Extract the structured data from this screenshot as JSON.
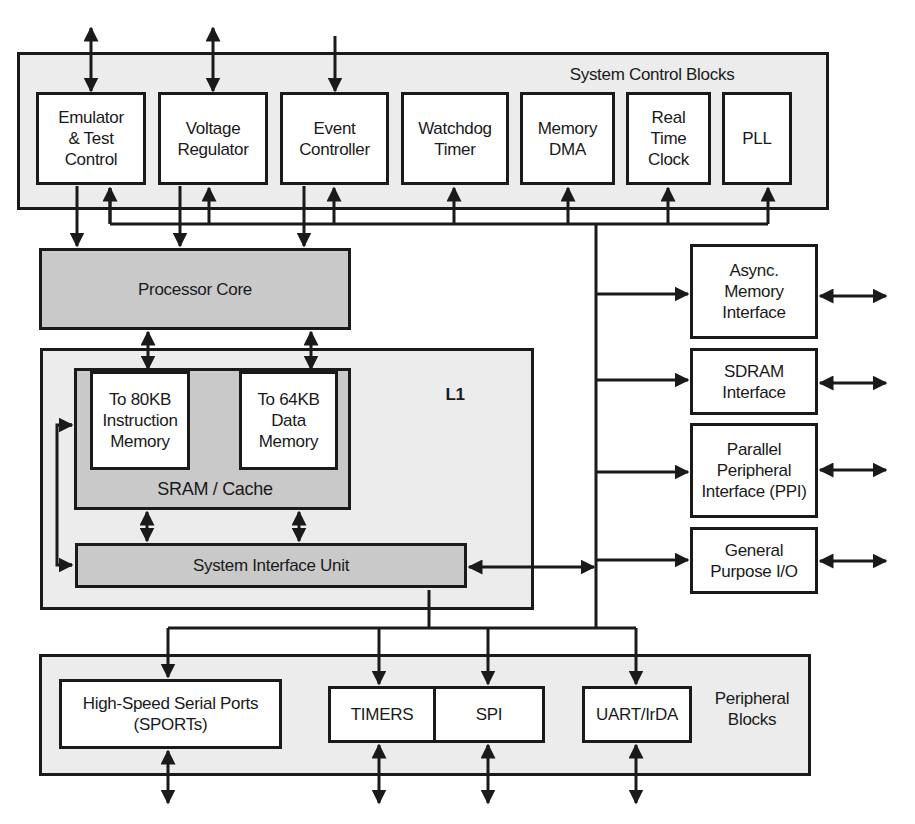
{
  "system_control": {
    "title": "System Control Blocks",
    "blocks": [
      {
        "label": "Emulator\n& Test\nControl"
      },
      {
        "label": "Voltage\nRegulator"
      },
      {
        "label": "Event\nController"
      },
      {
        "label": "Watchdog\nTimer"
      },
      {
        "label": "Memory\nDMA"
      },
      {
        "label": "Real\nTime\nClock"
      },
      {
        "label": "PLL"
      }
    ]
  },
  "processor_core": {
    "label": "Processor Core"
  },
  "l1": {
    "title": "L1",
    "sram_cache": {
      "label": "SRAM / Cache"
    },
    "instruction_memory": {
      "label": "To 80KB\nInstruction\nMemory"
    },
    "data_memory": {
      "label": "To 64KB\nData\nMemory"
    },
    "system_interface_unit": {
      "label": "System Interface Unit"
    }
  },
  "external_interfaces": [
    {
      "label": "Async.\nMemory\nInterface"
    },
    {
      "label": "SDRAM\nInterface"
    },
    {
      "label": "Parallel\nPeripheral\nInterface (PPI)"
    },
    {
      "label": "General\nPurpose I/O"
    }
  ],
  "peripheral": {
    "title": "Peripheral\nBlocks",
    "blocks": [
      {
        "label": "High-Speed Serial Ports\n(SPORTs)"
      },
      {
        "label": "TIMERS"
      },
      {
        "label": "SPI"
      },
      {
        "label": "UART/IrDA"
      }
    ]
  },
  "colors": {
    "line": "#1a1a1a",
    "group_fill": "#ececec",
    "core_fill": "#c9c9c9",
    "block_fill": "#ffffff"
  }
}
